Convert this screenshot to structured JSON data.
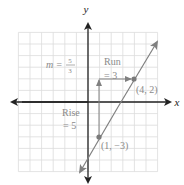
{
  "figure": {
    "axis_labels": {
      "x": "x",
      "y": "y"
    },
    "slope_label": {
      "prefix": "m =",
      "numerator": "5",
      "denominator": "3"
    },
    "run_label": {
      "line1": "Run",
      "line2": "= 3"
    },
    "rise_label": {
      "line1": "Rise",
      "line2": "= 5"
    },
    "points": [
      {
        "label": "(4, 2)",
        "x": 4,
        "y": 2
      },
      {
        "label": "(1, −3)",
        "x": 1,
        "y": -3
      }
    ],
    "colors": {
      "axis": "#222222",
      "grid": "#dcdcdc",
      "line": "#808080",
      "text": "#8a8a8a",
      "point": "#7a7a7a"
    }
  },
  "chart_data": {
    "type": "line",
    "title": "",
    "xlabel": "x",
    "ylabel": "y",
    "xlim": [
      -6,
      6
    ],
    "ylim": [
      -6,
      6
    ],
    "grid": true,
    "series": [
      {
        "name": "y = (5/3)x - 14/3",
        "x": [
          1,
          4
        ],
        "y": [
          -3,
          2
        ]
      }
    ],
    "annotations": [
      "m = 5/3",
      "Run = 3",
      "Rise = 5",
      "(4, 2)",
      "(1, −3)"
    ]
  }
}
